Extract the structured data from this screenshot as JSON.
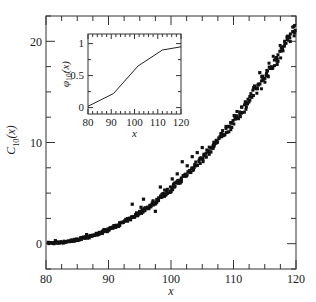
{
  "chart_data": [
    {
      "id": "main",
      "type": "scatter",
      "title": "",
      "xlabel": "x",
      "ylabel": "C_10(x)",
      "ylabel_base": "C",
      "ylabel_sub": "10",
      "ylabel_arg": "(x)",
      "xlim": [
        80,
        120
      ],
      "ylim": [
        -2.5,
        22.5
      ],
      "x_ticks": [
        80,
        90,
        100,
        110,
        120
      ],
      "x_tick_labels": [
        "80",
        "90",
        "100",
        "110",
        "120"
      ],
      "x_minor_step": 2.5,
      "y_ticks": [
        0,
        10,
        20
      ],
      "y_tick_labels": [
        "0",
        "10",
        "20"
      ],
      "y_minor_step": 2.5,
      "grid": false,
      "legend": null,
      "marker": "square",
      "color": "#111111",
      "series": [
        {
          "name": "C_10(x)",
          "trend": "approximately (x-80)^2 / 76, dense band of points",
          "x": [
            80.5,
            81,
            81.5,
            82,
            82.5,
            83,
            83.5,
            84,
            84.5,
            85,
            85.5,
            86,
            86.5,
            87,
            87.5,
            88,
            88.5,
            89,
            89.5,
            90,
            90.5,
            91,
            91.5,
            92,
            92.5,
            93,
            93.5,
            94,
            94.5,
            95,
            95.5,
            96,
            96.5,
            97,
            97.5,
            98,
            98.5,
            99,
            99.5,
            100,
            100.5,
            101,
            101.5,
            102,
            102.5,
            103,
            103.5,
            104,
            104.5,
            105,
            105.5,
            106,
            106.5,
            107,
            107.5,
            108,
            108.5,
            109,
            109.5,
            110,
            110.5,
            111,
            111.5,
            112,
            112.5,
            113,
            113.5,
            114,
            114.5,
            115,
            115.5,
            116,
            116.5,
            117,
            117.5,
            118,
            118.5,
            119,
            119.5,
            120
          ],
          "y": [
            0.0,
            0.02,
            0.05,
            0.09,
            0.14,
            0.2,
            0.26,
            0.34,
            0.42,
            0.52,
            0.62,
            0.74,
            0.86,
            1.0,
            1.14,
            1.3,
            1.46,
            1.64,
            1.82,
            2.02,
            2.22,
            2.44,
            2.66,
            2.9,
            3.14,
            3.4,
            3.66,
            3.94,
            4.22,
            4.52,
            4.82,
            5.14,
            5.46,
            5.8,
            6.14,
            6.5,
            6.86,
            7.24,
            7.62,
            8.02,
            8.42,
            8.84,
            9.26,
            9.7,
            10.14,
            10.6,
            11.06,
            11.54,
            12.02,
            12.52,
            13.02,
            13.54,
            14.06,
            14.6,
            15.14,
            15.7,
            16.26,
            16.84,
            17.42,
            18.02,
            18.62,
            19.24,
            19.86,
            20.5,
            21.14,
            21.8,
            22.46,
            23.14,
            23.82,
            24.52,
            25.22,
            25.94,
            26.66,
            27.4,
            28.14,
            28.9,
            29.66,
            30.44,
            31.22,
            32.02
          ],
          "note": "y values above are (x-80)^2 scaled; rendered as (x-80)^2/76 with jitter"
        }
      ],
      "outliers": [
        {
          "x": 81.5,
          "y": 0.3
        },
        {
          "x": 86.5,
          "y": 0.9
        },
        {
          "x": 89.3,
          "y": 1.4
        },
        {
          "x": 92.8,
          "y": 2.4
        },
        {
          "x": 93.8,
          "y": 3.9
        },
        {
          "x": 95.2,
          "y": 3.6
        },
        {
          "x": 95.6,
          "y": 4.4
        },
        {
          "x": 97.5,
          "y": 3.2
        },
        {
          "x": 98.3,
          "y": 5.6
        },
        {
          "x": 99.0,
          "y": 5.3
        },
        {
          "x": 100.2,
          "y": 6.4
        },
        {
          "x": 101.0,
          "y": 6.9
        },
        {
          "x": 101.8,
          "y": 8.1
        },
        {
          "x": 102.6,
          "y": 7.7
        },
        {
          "x": 103.4,
          "y": 8.6
        },
        {
          "x": 104.2,
          "y": 9.0
        },
        {
          "x": 105.0,
          "y": 9.5
        },
        {
          "x": 114.2,
          "y": 16.9
        }
      ]
    },
    {
      "id": "inset",
      "type": "line",
      "title": "",
      "xlabel": "x",
      "ylabel": "phi_10(x)",
      "ylabel_base": "φ",
      "ylabel_sub": "10",
      "ylabel_arg": "(x)",
      "xlim": [
        80,
        120
      ],
      "ylim": [
        -0.1,
        1.15
      ],
      "x_ticks": [
        80,
        90,
        100,
        110,
        120
      ],
      "x_tick_labels": [
        "80",
        "90",
        "100",
        "110",
        "120"
      ],
      "x_minor_step": 2,
      "y_ticks": [
        0,
        0.5,
        1
      ],
      "y_tick_labels": [
        "0",
        "0.5",
        "1"
      ],
      "y_minor_step": 0.25,
      "grid": false,
      "legend": null,
      "color": "#222222",
      "series": [
        {
          "name": "phi_10(x)",
          "x": [
            80,
            91,
            101.5,
            112,
            120
          ],
          "y": [
            0.02,
            0.22,
            0.65,
            0.9,
            0.95
          ]
        }
      ]
    }
  ]
}
